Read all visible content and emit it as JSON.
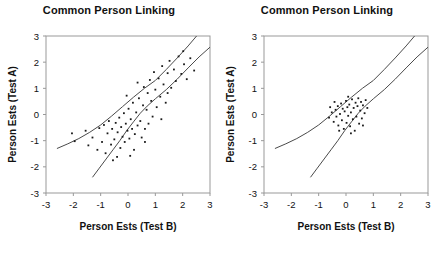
{
  "figure": {
    "panels": [
      {
        "name": "left-panel",
        "title": "Common Person Linking"
      },
      {
        "name": "right-panel",
        "title": "Common Person Linking"
      }
    ]
  },
  "chart_data": [
    {
      "type": "scatter",
      "title": "Common Person Linking",
      "xlabel": "Person Ests (Test B)",
      "ylabel": "Person Ests (Test A)",
      "xlim": [
        -3,
        3
      ],
      "ylim": [
        -3,
        3
      ],
      "xticks": [
        "-3",
        "-2",
        "-1",
        "0",
        "1",
        "2",
        "3"
      ],
      "yticks": [
        "3",
        "2",
        "1",
        "0",
        "-1",
        "-2",
        "-3"
      ],
      "xtick_values": [
        -3,
        -2,
        -1,
        0,
        1,
        2,
        3
      ],
      "ytick_values": [
        3,
        2,
        1,
        0,
        -1,
        -2,
        -3
      ],
      "grid": false,
      "legend": null,
      "points": [
        [
          -2.05,
          -0.72
        ],
        [
          -1.95,
          -1.02
        ],
        [
          -1.55,
          -0.62
        ],
        [
          -1.45,
          -1.18
        ],
        [
          -1.3,
          -0.88
        ],
        [
          -1.12,
          -1.35
        ],
        [
          -1.05,
          -0.52
        ],
        [
          -0.95,
          -1.05
        ],
        [
          -0.88,
          -0.4
        ],
        [
          -0.82,
          -1.48
        ],
        [
          -0.75,
          -0.72
        ],
        [
          -0.7,
          -0.25
        ],
        [
          -0.62,
          -1.15
        ],
        [
          -0.58,
          -0.55
        ],
        [
          -0.5,
          -0.95
        ],
        [
          -0.45,
          -0.32
        ],
        [
          -0.4,
          -1.62
        ],
        [
          -0.38,
          -0.68
        ],
        [
          -0.32,
          -0.12
        ],
        [
          -0.28,
          -1.28
        ],
        [
          -0.25,
          -0.48
        ],
        [
          -0.2,
          -0.85
        ],
        [
          -0.15,
          0.05
        ],
        [
          -0.12,
          -1.05
        ],
        [
          -0.08,
          -0.35
        ],
        [
          -0.02,
          -0.62
        ],
        [
          0.02,
          0.22
        ],
        [
          0.05,
          -0.92
        ],
        [
          0.1,
          -0.18
        ],
        [
          0.15,
          -0.55
        ],
        [
          0.18,
          0.45
        ],
        [
          0.22,
          -1.35
        ],
        [
          0.25,
          -0.75
        ],
        [
          0.3,
          0.08
        ],
        [
          0.35,
          -0.42
        ],
        [
          0.4,
          0.62
        ],
        [
          0.45,
          -0.25
        ],
        [
          0.5,
          -0.88
        ],
        [
          0.55,
          0.35
        ],
        [
          0.58,
          1.05
        ],
        [
          0.62,
          -0.55
        ],
        [
          0.68,
          0.18
        ],
        [
          0.72,
          0.82
        ],
        [
          0.75,
          -0.35
        ],
        [
          0.8,
          1.32
        ],
        [
          0.85,
          0.52
        ],
        [
          0.9,
          -0.08
        ],
        [
          0.95,
          1.62
        ],
        [
          1.0,
          0.95
        ],
        [
          1.05,
          0.28
        ],
        [
          1.12,
          1.38
        ],
        [
          1.18,
          0.68
        ],
        [
          1.25,
          1.85
        ],
        [
          1.3,
          1.15
        ],
        [
          1.38,
          0.45
        ],
        [
          1.45,
          1.58
        ],
        [
          1.52,
          2.05
        ],
        [
          1.58,
          1.02
        ],
        [
          1.68,
          1.72
        ],
        [
          1.75,
          1.28
        ],
        [
          1.85,
          2.22
        ],
        [
          1.95,
          1.55
        ],
        [
          2.05,
          1.92
        ],
        [
          2.15,
          1.35
        ],
        [
          2.28,
          2.15
        ],
        [
          2.42,
          1.68
        ],
        [
          -0.55,
          -1.75
        ],
        [
          0.08,
          -1.58
        ],
        [
          0.62,
          -1.05
        ],
        [
          1.22,
          -0.18
        ],
        [
          0.35,
          1.22
        ],
        [
          -0.05,
          0.72
        ],
        [
          1.45,
          0.82
        ],
        [
          2.02,
          2.42
        ]
      ]
    },
    {
      "type": "scatter",
      "title": "Common Person Linking",
      "xlabel": "Person Ests (Test B)",
      "ylabel": "Person Ests (Test A)",
      "xlim": [
        -3,
        3
      ],
      "ylim": [
        -3,
        3
      ],
      "xticks": [
        "-3",
        "-2",
        "-1",
        "0",
        "1",
        "2",
        "3"
      ],
      "yticks": [
        "3",
        "2",
        "1",
        "0",
        "-1",
        "-2",
        "-3"
      ],
      "xtick_values": [
        -3,
        -2,
        -1,
        0,
        1,
        2,
        3
      ],
      "ytick_values": [
        3,
        2,
        1,
        0,
        -1,
        -2,
        -3
      ],
      "grid": false,
      "legend": null,
      "points": [
        [
          -0.62,
          -0.12
        ],
        [
          -0.52,
          0.08
        ],
        [
          -0.45,
          -0.28
        ],
        [
          -0.38,
          0.18
        ],
        [
          -0.35,
          -0.08
        ],
        [
          -0.3,
          0.32
        ],
        [
          -0.28,
          -0.42
        ],
        [
          -0.22,
          0.02
        ],
        [
          -0.18,
          0.42
        ],
        [
          -0.15,
          -0.22
        ],
        [
          -0.12,
          0.22
        ],
        [
          -0.08,
          -0.55
        ],
        [
          -0.05,
          0.12
        ],
        [
          0.0,
          0.52
        ],
        [
          0.02,
          -0.32
        ],
        [
          0.05,
          0.28
        ],
        [
          0.08,
          -0.05
        ],
        [
          0.12,
          0.38
        ],
        [
          0.15,
          -0.45
        ],
        [
          0.18,
          0.08
        ],
        [
          0.22,
          0.58
        ],
        [
          0.25,
          -0.18
        ],
        [
          0.28,
          0.25
        ],
        [
          0.32,
          -0.62
        ],
        [
          0.35,
          0.45
        ],
        [
          0.38,
          -0.08
        ],
        [
          0.42,
          0.32
        ],
        [
          0.45,
          0.62
        ],
        [
          0.48,
          -0.35
        ],
        [
          0.52,
          0.15
        ],
        [
          0.55,
          0.48
        ],
        [
          0.58,
          -0.15
        ],
        [
          0.62,
          0.35
        ],
        [
          0.68,
          0.05
        ],
        [
          0.72,
          0.55
        ],
        [
          0.78,
          0.25
        ],
        [
          -0.42,
          0.48
        ],
        [
          -0.25,
          -0.62
        ],
        [
          0.18,
          -0.72
        ],
        [
          0.08,
          0.68
        ],
        [
          -0.58,
          0.28
        ],
        [
          0.62,
          -0.42
        ]
      ]
    }
  ]
}
